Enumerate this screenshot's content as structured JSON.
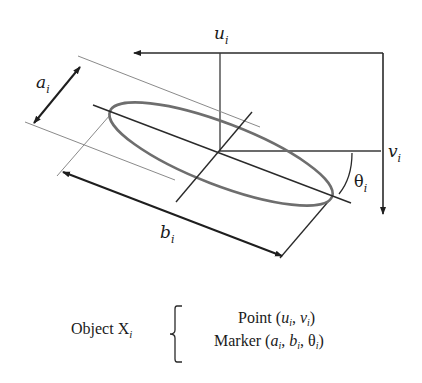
{
  "diagram": {
    "labels": {
      "u": "u",
      "u_sub": "i",
      "v": "v",
      "v_sub": "i",
      "a": "a",
      "a_sub": "i",
      "b": "b",
      "b_sub": "i",
      "theta": "θ",
      "theta_sub": "i"
    },
    "colors": {
      "axis": "#2a2a2a",
      "ellipse": "#6e6e6e",
      "tangent": "#8a8a8a",
      "text": "#1a1a1a"
    }
  },
  "caption": {
    "object_label": "Object X",
    "object_sub": "i",
    "point_line": {
      "prefix": "Point (",
      "u": "u",
      "u_sub": "i",
      "sep": ", ",
      "v": "v",
      "v_sub": "i",
      "suffix": ")"
    },
    "marker_line": {
      "prefix": "Marker (",
      "a": "a",
      "a_sub": "i",
      "sep1": ", ",
      "b": "b",
      "b_sub": "i",
      "sep2": ", ",
      "theta": "θ",
      "theta_sub": "i",
      "suffix": ")"
    }
  }
}
